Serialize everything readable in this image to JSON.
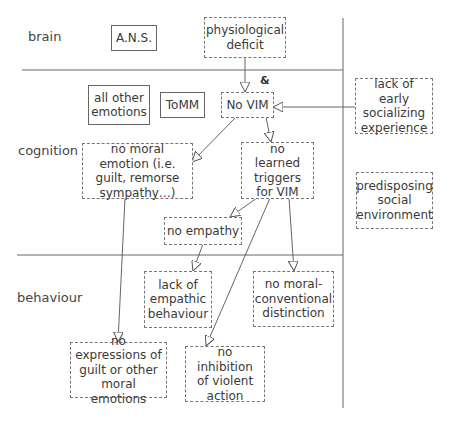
{
  "levels": {
    "brain": "brain",
    "cognition": "cognition",
    "behaviour": "behaviour"
  },
  "nodes": {
    "ans": "A.N.S.",
    "physiological_deficit": "physiological deficit",
    "all_other_emotions": "all other emotions",
    "tomm": "ToMM",
    "no_vim": "No VIM",
    "lack_early_socializing": "lack of early socializing experience",
    "no_moral_emotion": "no moral emotion (i.e. guilt, remorse sympathy…)",
    "no_learned_triggers": "no learned triggers for VIM",
    "predisposing_social_env": "predisposing social environment",
    "no_empathy": "no empathy",
    "lack_empathic_behaviour": "lack of empathic behaviour",
    "no_moral_conventional": "no moral-conventional distinction",
    "no_expressions": "no expressions of guilt or other moral emotions",
    "no_inhibition": "no inhibition of violent action"
  },
  "conjunction_symbol": "&",
  "edges": [
    {
      "from": "physiological_deficit",
      "to": "no_vim"
    },
    {
      "from": "lack_early_socializing",
      "to": "no_vim"
    },
    {
      "from": "no_vim",
      "to": "no_moral_emotion"
    },
    {
      "from": "no_vim",
      "to": "no_learned_triggers"
    },
    {
      "from": "no_learned_triggers",
      "to": "no_empathy"
    },
    {
      "from": "no_learned_triggers",
      "to": "no_inhibition"
    },
    {
      "from": "no_learned_triggers",
      "to": "no_moral_conventional"
    },
    {
      "from": "no_empathy",
      "to": "lack_empathic_behaviour"
    },
    {
      "from": "no_moral_emotion",
      "to": "no_expressions"
    }
  ],
  "colors": {
    "line": "#555555",
    "text": "#3a3a3a",
    "background": "#ffffff"
  }
}
